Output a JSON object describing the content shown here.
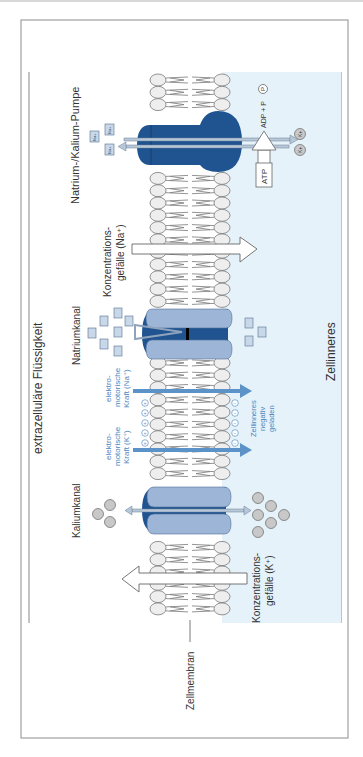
{
  "diagram": {
    "title_extracellular": "extrazelluläre Flüssigkeit",
    "title_intracellular": "Zellinneres",
    "membrane_label": "Zellmembran",
    "colors": {
      "frame": "#a0a0a0",
      "interior_fill": "#e6f2f9",
      "pump_blue": "#1f5491",
      "channel_light": "#9db5d6",
      "channel_dark": "#1f5491",
      "emf_blue": "#5b93c8",
      "head_fill": "#eeeeee",
      "ion_na_fill": "#c9d8e8",
      "ion_k_fill": "#c8c8c8"
    },
    "pump": {
      "label": "Natrium-/Kalium-Pumpe",
      "na_ions": [
        "Na+",
        "Na+",
        "Na+"
      ],
      "k_ions": [
        "K+",
        "K+"
      ],
      "atp_label": "ATP",
      "adp_label": "ADP + P",
      "phosphate": "P"
    },
    "gradient_na": {
      "line1": "Konzentrations-",
      "line2": "gefälle (Na⁺)"
    },
    "sodium_channel": {
      "label": "Natriumkanal",
      "na_outside": [
        "Na+",
        "Na+",
        "Na+",
        "Na+",
        "Na+",
        "Na+",
        "Na+"
      ],
      "na_inside": [
        "Na+",
        "Na+",
        "Na+"
      ]
    },
    "emf_na": {
      "line1": "elektro-",
      "line2": "motorische",
      "line3": "Kraft (Na⁺)"
    },
    "emf_k": {
      "line1": "elektro-",
      "line2": "motorische",
      "line3": "Kraft (K⁺)"
    },
    "interior_charge": {
      "line1": "Zellinneres",
      "line2": "negativ",
      "line3": "geladen"
    },
    "charges": {
      "outside": "+",
      "inside": "−",
      "outside_count": 5,
      "inside_count": 5
    },
    "potassium_channel": {
      "label": "Kaliumkanal",
      "k_outside": [
        "K+",
        "K+",
        "K+"
      ],
      "k_inside": [
        "K+",
        "K+",
        "K+",
        "K+",
        "K+",
        "K+"
      ]
    },
    "gradient_k": {
      "line1": "Konzentrations-",
      "line2": "gefälle (K⁺)"
    }
  }
}
